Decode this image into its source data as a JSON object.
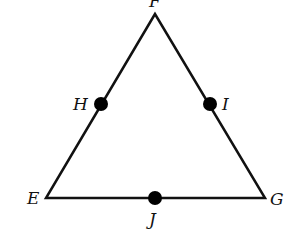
{
  "diagram": {
    "type": "triangle",
    "vertices": {
      "F": {
        "label": "F",
        "x": 155,
        "y": 14
      },
      "E": {
        "label": "E",
        "x": 46,
        "y": 198
      },
      "G": {
        "label": "G",
        "x": 265,
        "y": 198
      }
    },
    "points": {
      "H": {
        "label": "H",
        "x": 101,
        "y": 104
      },
      "I": {
        "label": "I",
        "x": 210,
        "y": 104
      },
      "J": {
        "label": "J",
        "x": 155,
        "y": 198
      }
    },
    "stroke_color": "#111111",
    "point_color": "#000000"
  }
}
